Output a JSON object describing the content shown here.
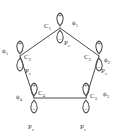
{
  "figure": {
    "kind": "orbital-diagram",
    "shape": "pentagon",
    "background_color": "#ffffff",
    "stroke_color": "#4a4a4a",
    "text_color": "#3a3a3a"
  },
  "lobes": {
    "positive_sign": "+",
    "negative_sign": "−"
  },
  "vertices": [
    {
      "id": "top",
      "atom": "C",
      "atom_sub": "1",
      "phi": "ϕ",
      "phi_sub": "1",
      "orbital": "P",
      "orbital_sub": "z",
      "atom_label": "C₁",
      "phi_label": "ϕ₁",
      "orbital_label": "Pᶻ"
    },
    {
      "id": "right",
      "atom": "C",
      "atom_sub": "2",
      "phi": "ϕ",
      "phi_sub": "2",
      "orbital": "P",
      "orbital_sub": "z",
      "atom_label": "C₂",
      "phi_label": "ϕ₂",
      "orbital_label": "Pᶻ"
    },
    {
      "id": "bottom-right",
      "atom": "C",
      "atom_sub": "3",
      "phi": "ϕ",
      "phi_sub": "3",
      "orbital": "P",
      "orbital_sub": "z",
      "atom_label": "C₃",
      "phi_label": "ϕ₃",
      "orbital_label": "Pᶻ"
    },
    {
      "id": "bottom-left",
      "atom": "C",
      "atom_sub": "4",
      "phi": "ϕ",
      "phi_sub": "4",
      "orbital": "P",
      "orbital_sub": "z",
      "atom_label": "C₄",
      "phi_label": "ϕ₄",
      "orbital_label": "Pᶻ"
    },
    {
      "id": "left",
      "atom": "C",
      "atom_sub": "2",
      "phi": "ϕ",
      "phi_sub": "5",
      "orbital": "P",
      "orbital_sub": "z",
      "atom_label": "C₂",
      "phi_label": "ϕ₅",
      "orbital_label": "Pᶻ"
    }
  ],
  "labels": {
    "c1": "C",
    "c1_sub": "1",
    "phi1": "ϕ",
    "phi1_sub": "1",
    "pz1": "P",
    "pz1_sub": "z",
    "c2r": "C",
    "c2r_sub": "2",
    "phi2": "ϕ",
    "phi2_sub": "2",
    "pz2": "P",
    "pz2_sub": "z",
    "c3": "C",
    "c3_sub": "3",
    "phi3": "ϕ",
    "phi3_sub": "3",
    "pz3": "P",
    "pz3_sub": "z",
    "c4": "C",
    "c4_sub": "4",
    "phi4": "ϕ",
    "phi4_sub": "4",
    "pz4": "P",
    "pz4_sub": "z",
    "c2l": "C",
    "c2l_sub": "2",
    "phi5": "ϕ",
    "phi5_sub": "5",
    "pz5": "P",
    "pz5_sub": "z",
    "plus": "+",
    "minus": "−"
  }
}
